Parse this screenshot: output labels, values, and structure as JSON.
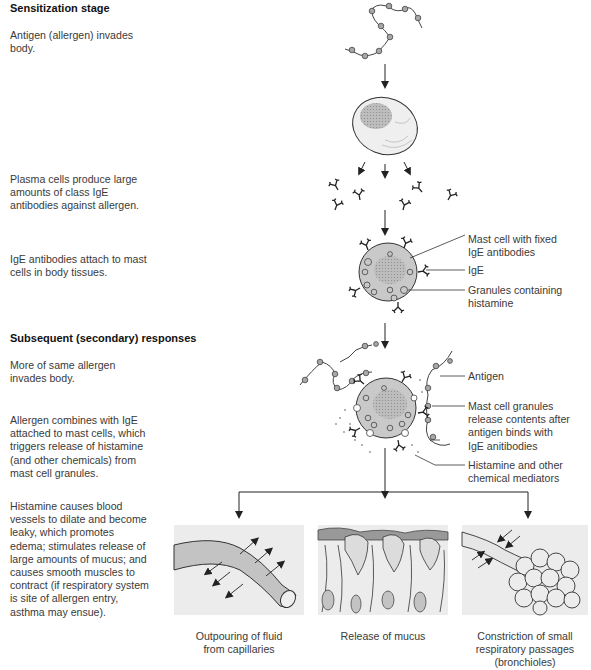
{
  "sections": {
    "sensitization": {
      "heading": "Sensitization stage",
      "steps": [
        "Antigen (allergen) invades\nbody.",
        "Plasma cells produce large\namounts of class IgE\nantibodies against allergen.",
        "IgE antibodies attach to mast\ncells in body tissues."
      ]
    },
    "secondary": {
      "heading": "Subsequent (secondary) responses",
      "steps": [
        "More of same allergen\ninvades body.",
        "Allergen combines with IgE\nattached to mast cells, which\ntriggers release of histamine\n(and other chemicals) from\nmast cell granules.",
        "Histamine causes blood\nvessels to dilate and become\nleaky, which promotes\nedema; stimulates release of\nlarge amounts of mucus; and\ncauses smooth muscles to\ncontract (if respiratory system\nis site of allergen entry,\nasthma may ensue)."
      ]
    }
  },
  "callouts": {
    "mast_cell_fixed": "Mast cell with fixed\nIgE antibodies",
    "ige": "IgE",
    "granules": "Granules containing\nhistamine",
    "antigen": "Antigen",
    "granules_release": "Mast cell granules\nrelease contents after\nantigen binds with\nIgE anitibodies",
    "histamine": "Histamine and other\nchemical mediators"
  },
  "panels": [
    {
      "caption": "Outpouring of fluid\nfrom capillaries",
      "icon": "capillary-icon"
    },
    {
      "caption": "Release of mucus",
      "icon": "mucus-epithelium-icon"
    },
    {
      "caption": "Constriction of small\nrespiratory passages\n(bronchioles)",
      "icon": "bronchiole-icon"
    }
  ],
  "colors": {
    "cell_fill": "#c9c9c9",
    "nucleus_fill": "#b3b3b3",
    "panel_bg": "#ececec",
    "line": "#333333",
    "antigen_bead": "#a8a8a8"
  }
}
